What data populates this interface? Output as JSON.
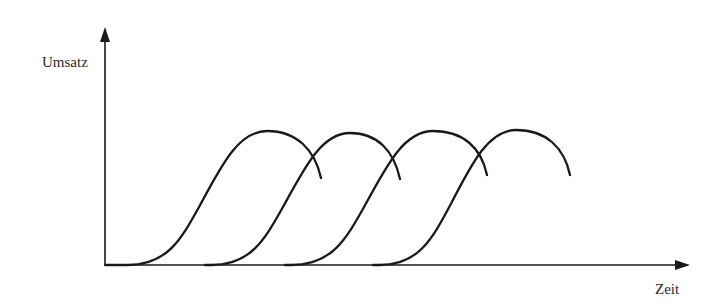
{
  "diagram": {
    "type": "product-life-cycle-succession",
    "y_axis": {
      "label": "Umsatz"
    },
    "x_axis": {
      "label": "Zeit"
    },
    "curves": [
      {
        "name": "product-1",
        "start_x": 105,
        "flat_until_x": 128,
        "peak": [
          267,
          131
        ],
        "end": [
          321,
          178
        ]
      },
      {
        "name": "product-2",
        "start_x": 205,
        "flat_until_x": 212,
        "peak": [
          350,
          133
        ],
        "end": [
          400,
          179
        ]
      },
      {
        "name": "product-3",
        "start_x": 285,
        "flat_until_x": 292,
        "peak": [
          433,
          131
        ],
        "end": [
          487,
          175
        ]
      },
      {
        "name": "product-4",
        "start_x": 373,
        "flat_until_x": 380,
        "peak": [
          516,
          130
        ],
        "end": [
          570,
          175
        ]
      }
    ],
    "origin": [
      105,
      265
    ],
    "y_axis_top": 28,
    "x_axis_right": 690
  }
}
